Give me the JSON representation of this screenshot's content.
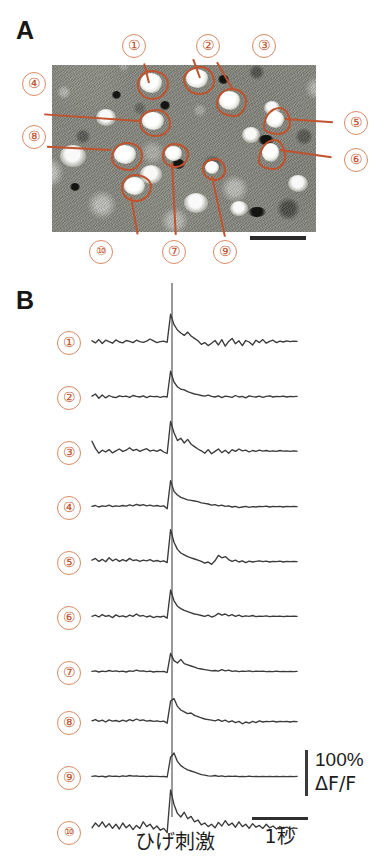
{
  "figure": {
    "panels": [
      {
        "letter": "A",
        "kind": "micrograph"
      },
      {
        "letter": "B",
        "kind": "traces"
      }
    ]
  },
  "panel_a": {
    "letter": "A",
    "description": "two-photon calcium imaging field of view with 10 outlined cell ROIs",
    "scalebar": {
      "visible": true
    },
    "roi_labels": [
      {
        "id": 1,
        "text": "①",
        "label_x": 133,
        "label_y": 34,
        "roi_x": 148,
        "roi_y": 82
      },
      {
        "id": 2,
        "text": "②",
        "label_x": 206,
        "label_y": 34,
        "roi_x": 196,
        "roi_y": 78
      },
      {
        "id": 3,
        "text": "③",
        "label_x": 262,
        "label_y": 34,
        "roi_x": 229,
        "roi_y": 100
      },
      {
        "id": 4,
        "text": "④",
        "label_x": 33,
        "label_y": 80,
        "roi_x": 150,
        "roi_y": 121
      },
      {
        "id": 5,
        "text": "⑤",
        "label_x": 333,
        "label_y": 120,
        "roi_x": 275,
        "roi_y": 120
      },
      {
        "id": 6,
        "text": "⑥",
        "label_x": 333,
        "label_y": 157,
        "roi_x": 270,
        "roi_y": 152
      },
      {
        "id": 7,
        "text": "⑦",
        "label_x": 173,
        "label_y": 249,
        "roi_x": 172,
        "roi_y": 154
      },
      {
        "id": 8,
        "text": "⑧",
        "label_x": 33,
        "label_y": 133,
        "roi_x": 122,
        "roi_y": 154
      },
      {
        "id": 9,
        "text": "⑨",
        "label_x": 223,
        "label_y": 249,
        "roi_x": 212,
        "roi_y": 168
      },
      {
        "id": 10,
        "text": "⑩",
        "label_x": 100,
        "label_y": 249,
        "roi_x": 132,
        "roi_y": 186
      }
    ]
  },
  "panel_b": {
    "letter": "B",
    "row_labels": [
      "①",
      "②",
      "③",
      "④",
      "⑤",
      "⑥",
      "⑦",
      "⑧",
      "⑨",
      "⑩"
    ],
    "stimulus_caption": "ひげ刺激",
    "calibration": {
      "amplitude": "100%",
      "unit": "ΔF/F"
    },
    "time_scale": {
      "label": "1秒"
    }
  },
  "colors": {
    "roi_outline": "#c0522d",
    "label_circle": "#d98a63",
    "label_text": "#c0522d",
    "trace": "#3a3a3a",
    "stim_line": "#9a9a9a",
    "scalebar": "#2b2b2b",
    "text": "#1d1d1d",
    "background": "#ffffff"
  },
  "chart_data": {
    "type": "line",
    "title": "",
    "xlabel": "ひげ刺激",
    "ylabel": "ΔF/F",
    "x_unit": "seconds",
    "time_scalebar_seconds": 1,
    "amplitude_scalebar_percent": 100,
    "stimulus_onset_fraction": 0.385,
    "n_points": 61,
    "series": [
      {
        "name": "①",
        "values": [
          0.04,
          -0.03,
          0.08,
          -0.05,
          0.06,
          0.01,
          -0.04,
          0.07,
          0.0,
          -0.03,
          0.05,
          0.02,
          -0.02,
          0.06,
          0.01,
          -0.01,
          0.03,
          0.1,
          0.04,
          -0.02,
          0.01,
          0.03,
          -0.01,
          0.93,
          0.58,
          0.4,
          0.3,
          0.22,
          0.33,
          0.2,
          0.12,
          0.04,
          -0.08,
          -0.02,
          -0.12,
          -0.04,
          0.05,
          -0.1,
          0.08,
          -0.14,
          0.02,
          0.12,
          -0.06,
          0.04,
          -0.12,
          0.05,
          0.0,
          -0.1,
          0.06,
          -0.02,
          0.08,
          -0.04,
          0.02,
          0.06,
          -0.02,
          0.03,
          0.0,
          0.04,
          0.01,
          0.03,
          0.02
        ]
      },
      {
        "name": "②",
        "values": [
          0.03,
          0.1,
          -0.04,
          0.07,
          -0.03,
          0.05,
          0.0,
          -0.02,
          0.04,
          0.01,
          0.03,
          -0.01,
          0.05,
          0.02,
          0.0,
          0.04,
          -0.02,
          0.03,
          0.01,
          0.02,
          -0.01,
          0.02,
          0.0,
          0.86,
          0.5,
          0.34,
          0.26,
          0.24,
          0.18,
          0.14,
          0.1,
          0.08,
          0.05,
          0.03,
          0.06,
          0.02,
          0.0,
          0.04,
          -0.02,
          0.03,
          0.01,
          -0.01,
          0.05,
          0.0,
          0.02,
          -0.03,
          0.04,
          0.01,
          0.0,
          0.03,
          -0.01,
          0.02,
          0.04,
          0.0,
          0.02,
          0.01,
          0.03,
          0.0,
          0.02,
          0.01,
          0.02
        ]
      },
      {
        "name": "③",
        "values": [
          0.36,
          0.12,
          -0.04,
          0.06,
          0.0,
          0.08,
          -0.03,
          0.04,
          0.1,
          0.02,
          0.06,
          0.14,
          0.05,
          0.09,
          0.02,
          0.07,
          0.11,
          0.03,
          0.06,
          0.02,
          0.08,
          0.0,
          -0.05,
          1.02,
          0.64,
          0.38,
          0.46,
          0.3,
          0.42,
          0.26,
          0.18,
          0.1,
          0.04,
          -0.04,
          0.08,
          -0.06,
          0.02,
          0.1,
          -0.02,
          0.06,
          -0.04,
          0.08,
          0.02,
          0.1,
          0.04,
          0.06,
          0.0,
          0.05,
          0.02,
          0.06,
          0.03,
          0.05,
          0.02,
          0.04,
          0.02,
          0.05,
          0.03,
          0.04,
          0.02,
          0.04,
          0.03
        ]
      },
      {
        "name": "④",
        "values": [
          0.02,
          0.05,
          0.0,
          0.04,
          0.02,
          0.06,
          0.01,
          0.04,
          0.02,
          0.05,
          0.03,
          0.07,
          0.04,
          0.09,
          0.05,
          0.08,
          0.04,
          0.06,
          0.03,
          0.05,
          0.02,
          0.04,
          -0.06,
          0.88,
          0.52,
          0.4,
          0.32,
          0.28,
          0.24,
          0.22,
          0.2,
          0.18,
          0.14,
          0.12,
          0.1,
          0.06,
          0.08,
          0.04,
          0.06,
          0.02,
          0.04,
          0.0,
          0.02,
          -0.02,
          0.0,
          0.02,
          -0.01,
          0.01,
          0.0,
          0.02,
          0.01,
          0.03,
          0.0,
          0.02,
          0.01,
          0.02,
          0.0,
          0.02,
          0.01,
          0.02,
          0.01
        ]
      },
      {
        "name": "⑤",
        "values": [
          0.06,
          0.12,
          0.02,
          0.09,
          0.01,
          0.14,
          0.04,
          0.1,
          0.02,
          0.08,
          0.03,
          0.12,
          0.05,
          0.07,
          0.02,
          0.06,
          0.04,
          0.08,
          0.02,
          0.05,
          0.01,
          0.04,
          -0.02,
          1.08,
          0.66,
          0.42,
          0.3,
          0.24,
          0.18,
          0.14,
          0.1,
          0.06,
          0.02,
          -0.04,
          0.0,
          -0.08,
          0.04,
          0.22,
          0.14,
          0.18,
          0.08,
          0.02,
          0.06,
          0.0,
          0.04,
          -0.02,
          0.03,
          0.0,
          0.02,
          0.04,
          0.01,
          0.03,
          0.0,
          0.02,
          0.01,
          0.03,
          0.0,
          0.02,
          0.01,
          0.02,
          0.01
        ]
      },
      {
        "name": "⑥",
        "values": [
          0.02,
          0.06,
          0.0,
          0.08,
          0.02,
          0.05,
          -0.02,
          0.07,
          0.01,
          0.04,
          0.0,
          0.06,
          0.02,
          0.1,
          0.03,
          0.05,
          0.0,
          0.04,
          -0.02,
          0.02,
          0.0,
          0.03,
          -0.04,
          0.9,
          0.54,
          0.36,
          0.28,
          0.22,
          0.18,
          0.14,
          0.1,
          0.08,
          0.05,
          0.02,
          0.06,
          0.0,
          0.04,
          0.12,
          0.06,
          0.1,
          0.04,
          0.08,
          0.02,
          0.06,
          0.01,
          0.04,
          0.02,
          0.05,
          0.01,
          0.03,
          0.02,
          0.04,
          0.01,
          0.03,
          0.02,
          0.03,
          0.01,
          0.03,
          0.02,
          0.03,
          0.02
        ]
      },
      {
        "name": "⑦",
        "values": [
          0.02,
          0.04,
          0.0,
          0.03,
          0.01,
          0.05,
          0.02,
          0.04,
          0.01,
          0.03,
          0.0,
          0.04,
          0.02,
          0.06,
          0.03,
          0.04,
          0.01,
          0.03,
          0.0,
          0.02,
          0.01,
          0.02,
          -0.02,
          0.62,
          0.38,
          0.3,
          0.42,
          0.28,
          0.24,
          0.2,
          0.16,
          0.12,
          0.1,
          0.08,
          0.06,
          0.04,
          0.05,
          0.03,
          0.08,
          0.04,
          0.06,
          0.02,
          0.04,
          0.01,
          0.03,
          0.02,
          0.04,
          0.01,
          0.03,
          0.02,
          0.03,
          0.01,
          0.02,
          0.01,
          0.03,
          0.01,
          0.02,
          0.01,
          0.02,
          0.01,
          0.02
        ]
      },
      {
        "name": "⑧",
        "values": [
          0.04,
          0.08,
          0.02,
          0.06,
          0.0,
          0.07,
          0.03,
          0.05,
          0.01,
          0.06,
          0.02,
          0.08,
          0.04,
          0.1,
          0.05,
          0.07,
          0.03,
          0.05,
          0.02,
          0.04,
          0.01,
          0.03,
          -0.04,
          0.7,
          0.78,
          0.52,
          0.4,
          0.34,
          0.28,
          0.3,
          0.22,
          0.18,
          0.14,
          0.1,
          0.08,
          0.06,
          0.04,
          0.08,
          0.02,
          0.06,
          0.0,
          0.04,
          -0.02,
          0.02,
          -0.06,
          0.0,
          -0.04,
          0.02,
          -0.02,
          0.04,
          0.0,
          0.02,
          0.01,
          0.03,
          0.0,
          0.02,
          0.01,
          0.02,
          0.0,
          0.02,
          0.01
        ]
      },
      {
        "name": "⑨",
        "values": [
          0.02,
          0.04,
          0.01,
          0.03,
          0.0,
          0.04,
          0.02,
          0.03,
          0.01,
          0.04,
          0.02,
          0.05,
          0.03,
          0.04,
          0.02,
          0.03,
          0.01,
          0.03,
          0.02,
          0.02,
          0.01,
          0.02,
          0.0,
          0.66,
          0.8,
          0.52,
          0.38,
          0.3,
          0.24,
          0.2,
          0.16,
          0.12,
          0.08,
          0.06,
          0.04,
          0.03,
          0.05,
          0.02,
          0.04,
          0.01,
          0.03,
          0.02,
          0.03,
          0.01,
          0.02,
          0.01,
          0.03,
          0.01,
          0.02,
          0.01,
          0.02,
          0.01,
          0.02,
          0.01,
          0.02,
          0.01,
          0.02,
          0.01,
          0.02,
          0.01,
          0.02
        ]
      },
      {
        "name": "⑩",
        "values": [
          0.14,
          0.3,
          0.18,
          0.34,
          0.16,
          0.28,
          0.12,
          0.26,
          0.1,
          0.3,
          0.14,
          0.24,
          0.08,
          0.22,
          0.12,
          0.34,
          0.18,
          0.26,
          0.1,
          0.2,
          0.06,
          0.12,
          -0.02,
          1.4,
          0.92,
          0.62,
          0.5,
          0.66,
          0.44,
          0.52,
          0.34,
          0.4,
          0.24,
          0.3,
          0.18,
          0.26,
          0.14,
          0.32,
          0.2,
          0.38,
          0.22,
          0.3,
          0.16,
          0.34,
          0.18,
          0.26,
          0.12,
          0.28,
          0.16,
          0.22,
          0.12,
          0.26,
          0.14,
          0.2,
          0.1,
          0.18,
          0.12,
          0.16,
          0.1,
          0.14,
          0.12
        ]
      }
    ]
  }
}
